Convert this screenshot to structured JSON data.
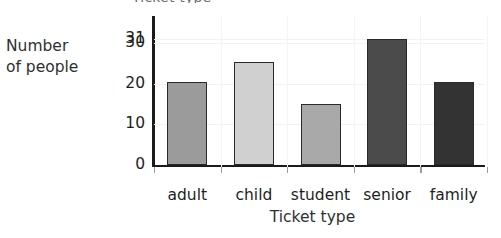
{
  "chart_data": {
    "type": "bar",
    "title": "Ticket type",
    "title_cropped": true,
    "xlabel": "Ticket type",
    "ylabel": "Number\nof people",
    "categories": [
      "adult",
      "child",
      "student",
      "senior",
      "family"
    ],
    "values": [
      20.5,
      25.5,
      15,
      31,
      20.5
    ],
    "bar_colors": [
      "#9b9b9b",
      "#d0d0d0",
      "#a9a9a9",
      "#4b4b4b",
      "#333333"
    ],
    "ylim": [
      0,
      34
    ],
    "yticks": [
      {
        "value": 0,
        "label": "0"
      },
      {
        "value": 10,
        "label": "10"
      },
      {
        "value": 20,
        "label": "20"
      },
      {
        "value": 30,
        "label": "30"
      },
      {
        "value": 31,
        "label": "31"
      }
    ],
    "grid": true,
    "legend": null,
    "axis_color": "#1b1b1b",
    "grid_color": "#f1f1f1"
  },
  "axes": {
    "y_title": "Number\nof people",
    "x_title": "Ticket type"
  }
}
